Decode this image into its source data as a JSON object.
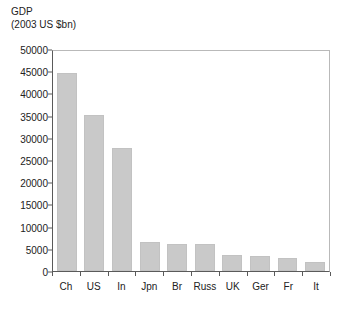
{
  "chart_data": {
    "type": "bar",
    "title": "GDP",
    "subtitle": "(2003 US $bn)",
    "xlabel": "",
    "ylabel": "",
    "ylim": [
      0,
      50000
    ],
    "yticks": [
      0,
      5000,
      10000,
      15000,
      20000,
      25000,
      30000,
      35000,
      40000,
      45000,
      50000
    ],
    "ytick_labels": [
      "0",
      "5000",
      "10000",
      "15000",
      "20000",
      "25000",
      "30000",
      "35000",
      "40000",
      "45000",
      "50000"
    ],
    "grid": false,
    "legend": null,
    "bar_color": "#c9c9c9",
    "axis_color": "#5a5a5a",
    "categories": [
      "Ch",
      "US",
      "In",
      "Jpn",
      "Br",
      "Russ",
      "UK",
      "Ger",
      "Fr",
      "It"
    ],
    "values": [
      44500,
      35200,
      27600,
      6600,
      6000,
      6000,
      3700,
      3400,
      3000,
      2000
    ]
  }
}
